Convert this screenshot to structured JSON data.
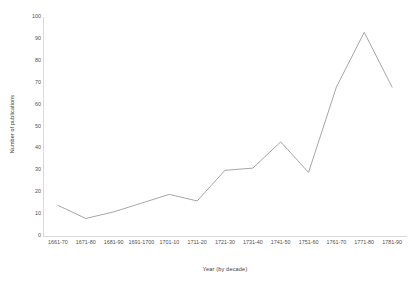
{
  "chart_data": {
    "type": "line",
    "title": "",
    "xlabel": "Year (by decade)",
    "ylabel": "Number of publications",
    "categories": [
      "1661-70",
      "1671-80",
      "1681-90",
      "1691-1700",
      "1701-10",
      "1711-20",
      "1721-30",
      "1731-40",
      "1741-50",
      "1751-60",
      "1761-70",
      "1771-80",
      "1781-90"
    ],
    "values": [
      14,
      8,
      11,
      15,
      19,
      16,
      30,
      31,
      43,
      29,
      68,
      93,
      68
    ],
    "ylim": [
      0,
      100
    ],
    "ytick_step": 10,
    "yticks": [
      0,
      10,
      20,
      30,
      40,
      50,
      60,
      70,
      80,
      90,
      100
    ],
    "grid": false,
    "legend": false,
    "markers": false,
    "series_color": "#a6a6a6",
    "axis_color": "#d9d9d9",
    "background": "#ffffff"
  }
}
